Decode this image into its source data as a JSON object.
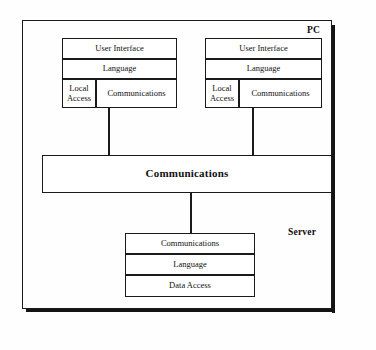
{
  "diagram": {
    "zones": {
      "client_label": "PC",
      "server_label": "Server"
    },
    "clients": [
      {
        "id": "client-left",
        "layers": [
          {
            "name": "user-interface",
            "label": "User Interface"
          },
          {
            "name": "language",
            "label": "Language"
          },
          {
            "name": "local-access",
            "label": "Local\nAccess"
          },
          {
            "name": "communications",
            "label": "Communications"
          }
        ]
      },
      {
        "id": "client-right",
        "layers": [
          {
            "name": "user-interface",
            "label": "User Interface"
          },
          {
            "name": "language",
            "label": "Language"
          },
          {
            "name": "local-access",
            "label": "Local\nAccess"
          },
          {
            "name": "communications",
            "label": "Communications"
          }
        ]
      }
    ],
    "network_bus": {
      "label": "Communications"
    },
    "server": {
      "layers": [
        {
          "name": "communications",
          "label": "Communications"
        },
        {
          "name": "language",
          "label": "Language"
        },
        {
          "name": "data-access",
          "label": "Data Access"
        }
      ]
    },
    "colors": {
      "stroke": "#1a1a1a",
      "fill": "#ffffff",
      "text": "#111111",
      "background": "#fefefe"
    }
  }
}
